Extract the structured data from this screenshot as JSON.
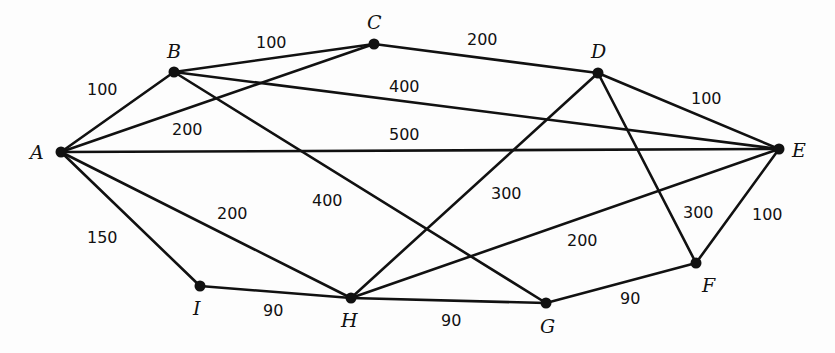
{
  "diagram": {
    "type": "weighted-undirected-graph",
    "vertices": [
      {
        "id": "A",
        "label": "A",
        "x": 61,
        "y": 152,
        "lx": 30,
        "ly": 159
      },
      {
        "id": "B",
        "label": "B",
        "x": 174,
        "y": 72,
        "lx": 167,
        "ly": 58
      },
      {
        "id": "C",
        "label": "C",
        "x": 374,
        "y": 44,
        "lx": 367,
        "ly": 29
      },
      {
        "id": "D",
        "label": "D",
        "x": 598,
        "y": 73,
        "lx": 591,
        "ly": 58
      },
      {
        "id": "E",
        "label": "E",
        "x": 779,
        "y": 149,
        "lx": 792,
        "ly": 157
      },
      {
        "id": "F",
        "label": "F",
        "x": 696,
        "y": 263,
        "lx": 702,
        "ly": 292
      },
      {
        "id": "G",
        "label": "G",
        "x": 546,
        "y": 303,
        "lx": 540,
        "ly": 333
      },
      {
        "id": "H",
        "label": "H",
        "x": 351,
        "y": 298,
        "lx": 341,
        "ly": 327
      },
      {
        "id": "I",
        "label": "I",
        "x": 200,
        "y": 286,
        "lx": 193,
        "ly": 315
      }
    ],
    "edges": [
      {
        "from": "A",
        "to": "B",
        "weight": "100",
        "lx": 87,
        "ly": 95
      },
      {
        "from": "B",
        "to": "C",
        "weight": "100",
        "lx": 256,
        "ly": 48
      },
      {
        "from": "A",
        "to": "C",
        "weight": "200",
        "lx": 172,
        "ly": 135
      },
      {
        "from": "C",
        "to": "D",
        "weight": "200",
        "lx": 467,
        "ly": 45
      },
      {
        "from": "B",
        "to": "E",
        "weight": "400",
        "lx": 389,
        "ly": 92
      },
      {
        "from": "A",
        "to": "E",
        "weight": "500",
        "lx": 389,
        "ly": 140
      },
      {
        "from": "D",
        "to": "E",
        "weight": "100",
        "lx": 691,
        "ly": 104
      },
      {
        "from": "B",
        "to": "G",
        "weight": "400",
        "lx": 312,
        "ly": 206
      },
      {
        "from": "D",
        "to": "H",
        "weight": "300",
        "lx": 491,
        "ly": 199
      },
      {
        "from": "A",
        "to": "H",
        "weight": "200",
        "lx": 217,
        "ly": 219
      },
      {
        "from": "A",
        "to": "I",
        "weight": "150",
        "lx": 87,
        "ly": 243
      },
      {
        "from": "H",
        "to": "E",
        "weight": "200",
        "lx": 567,
        "ly": 246
      },
      {
        "from": "D",
        "to": "F",
        "weight": "300",
        "lx": 683,
        "ly": 218
      },
      {
        "from": "E",
        "to": "F",
        "weight": "100",
        "lx": 752,
        "ly": 220
      },
      {
        "from": "I",
        "to": "H",
        "weight": "90",
        "lx": 263,
        "ly": 316
      },
      {
        "from": "H",
        "to": "G",
        "weight": "90",
        "lx": 441,
        "ly": 326
      },
      {
        "from": "G",
        "to": "F",
        "weight": "90",
        "lx": 620,
        "ly": 304
      }
    ]
  }
}
